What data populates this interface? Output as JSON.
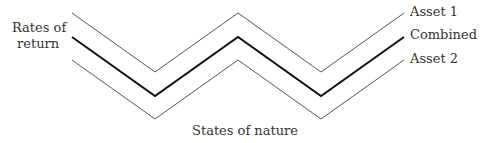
{
  "diagram": {
    "y_axis_label_line1": "Rates of",
    "y_axis_label_line2": "return",
    "x_axis_label": "States of nature",
    "series": [
      {
        "name": "Asset 1",
        "points": "72,13 155,72 238,13 321,72 404,13",
        "stroke": "#555555",
        "width": "1"
      },
      {
        "name": "Combined",
        "points": "72,37 155,96 238,37 321,96 404,37",
        "stroke": "#111111",
        "width": "2"
      },
      {
        "name": "Asset 2",
        "points": "72,60 155,119 238,60 321,119 404,60",
        "stroke": "#555555",
        "width": "1"
      }
    ]
  }
}
